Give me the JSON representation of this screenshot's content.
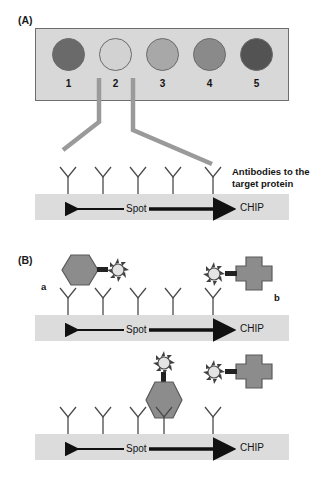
{
  "figure": {
    "background": "#ffffff"
  },
  "panels": [
    {
      "id": "A",
      "label": "(A)",
      "array": {
        "box_fill": "#d8d8d8",
        "box_border": "#6e6e6e",
        "spots": [
          {
            "number": "1",
            "fill": "#6a6a6a",
            "intensity": 0.58
          },
          {
            "number": "2",
            "fill": "#d2d2d2",
            "intensity": 0.12
          },
          {
            "number": "3",
            "fill": "#a8a8a8",
            "intensity": 0.33
          },
          {
            "number": "4",
            "fill": "#8a8a8a",
            "intensity": 0.46
          },
          {
            "number": "5",
            "fill": "#535353",
            "intensity": 0.68
          }
        ]
      },
      "guide_line_color": "#9a9a9a",
      "caption": {
        "line1": "Antibodies to the",
        "line2": "target protein"
      },
      "chip": {
        "spot_label": "Spot",
        "chip_label": "CHIP",
        "fill": "#dcdcdc",
        "antibody_count": 5
      }
    },
    {
      "id": "B",
      "label": "(B)",
      "analytes": [
        {
          "letter": "a",
          "shape": "hexagon",
          "fill": "#8c8c8c",
          "tag": "starburst"
        },
        {
          "letter": "b",
          "shape": "cross",
          "fill": "#8c8c8c",
          "tag": "starburst"
        }
      ],
      "diagrams": [
        {
          "name": "unbound-state",
          "chip": {
            "spot_label": "Spot",
            "chip_label": "CHIP",
            "fill": "#dcdcdc",
            "antibody_count": 5
          }
        },
        {
          "name": "bound-state",
          "chip": {
            "spot_label": "Spot",
            "chip_label": "CHIP",
            "fill": "#dcdcdc",
            "antibody_count": 5
          }
        }
      ]
    }
  ],
  "colors": {
    "antibody_stroke": "#4a4a4a",
    "arrow": "#111111",
    "analyte_fill": "#8c8c8c",
    "analyte_stroke": "#5a5a5a",
    "starburst_fill": "#e4e4e4",
    "starburst_stroke": "#4a4a4a",
    "text": "#141414"
  }
}
